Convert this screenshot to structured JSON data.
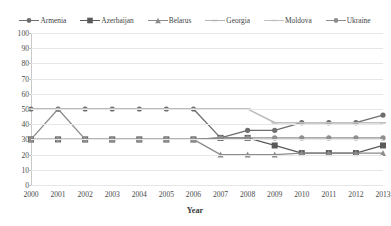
{
  "chart_data": {
    "type": "line",
    "title": "",
    "xlabel": "Year",
    "ylabel": "",
    "grid": true,
    "legend_position": "top",
    "categories": [
      2000,
      2001,
      2002,
      2003,
      2004,
      2005,
      2006,
      2007,
      2008,
      2009,
      2010,
      2011,
      2012,
      2013
    ],
    "x": [
      "2000",
      "2001",
      "2002",
      "2003",
      "2004",
      "2005",
      "2006",
      "2007",
      "2008",
      "2009",
      "2010",
      "2011",
      "2012",
      "2013"
    ],
    "xlim": [
      2000,
      2013
    ],
    "ylim": [
      0,
      100
    ],
    "ytick_labels": [
      "0",
      "10",
      "20",
      "30",
      "40",
      "50",
      "60",
      "70",
      "80",
      "90",
      "100"
    ],
    "yticks": [
      0,
      10,
      20,
      30,
      40,
      50,
      60,
      70,
      80,
      90,
      100
    ],
    "series": [
      {
        "name": "Armenia",
        "color": "#6e6e6e",
        "marker": "circle",
        "values": [
          50,
          50,
          50,
          50,
          50,
          50,
          50,
          31,
          36,
          36,
          41,
          41,
          41,
          46
        ]
      },
      {
        "name": "Azerbaijan",
        "color": "#5a5a5a",
        "marker": "square",
        "values": [
          30,
          30,
          30,
          30,
          30,
          30,
          30,
          31,
          31,
          26,
          21,
          21,
          21,
          26
        ]
      },
      {
        "name": "Belarus",
        "color": "#8c8c8c",
        "marker": "triangle",
        "values": [
          30,
          50,
          30,
          30,
          30,
          30,
          30,
          20,
          20,
          20,
          21,
          21,
          21,
          21
        ]
      },
      {
        "name": "Georgia",
        "color": "#b4b4b4",
        "marker": "plus",
        "values": [
          50,
          50,
          50,
          50,
          50,
          50,
          50,
          50,
          50,
          41,
          41,
          41,
          41,
          41
        ]
      },
      {
        "name": "Moldova",
        "color": "#c0c0c0",
        "marker": "dash",
        "values": [
          50,
          50,
          50,
          50,
          50,
          50,
          50,
          50,
          50,
          41,
          41,
          41,
          41,
          41
        ]
      },
      {
        "name": "Ukraine",
        "color": "#8f8f8f",
        "marker": "circle",
        "values": [
          30,
          30,
          30,
          30,
          30,
          30,
          30,
          31,
          31,
          31,
          31,
          31,
          31,
          31
        ]
      }
    ]
  }
}
